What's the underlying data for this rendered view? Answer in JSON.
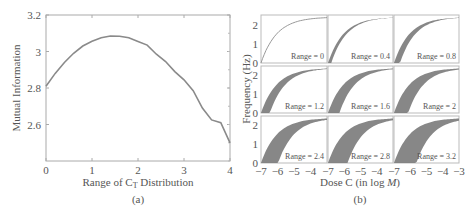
{
  "figure": {
    "caption_a": "(a)",
    "caption_b": "(b)"
  },
  "chart_data": [
    {
      "id": "a",
      "type": "line",
      "title": "",
      "xlabel": "Range of C",
      "xlabel_subscript": "T",
      "xlabel_suffix": " Distribution",
      "ylabel": "Mutual Information",
      "xlim": [
        0,
        4
      ],
      "ylim": [
        2.4,
        3.2
      ],
      "xticks": [
        0,
        1,
        2,
        3,
        4
      ],
      "xtick_labels": [
        "0",
        "1",
        "2",
        "3",
        "4"
      ],
      "yticks": [
        2.6,
        2.8,
        3.0,
        3.2
      ],
      "ytick_labels": [
        "2.6",
        "2.8",
        "3",
        "3.2"
      ],
      "grid": false,
      "series": [
        {
          "name": "Mutual Information",
          "color": "#8a8a8a",
          "x": [
            0,
            0.2,
            0.4,
            0.6,
            0.8,
            1.0,
            1.2,
            1.4,
            1.6,
            1.8,
            2.0,
            2.2,
            2.4,
            2.6,
            2.8,
            3.0,
            3.2,
            3.4,
            3.6,
            3.8,
            4.0
          ],
          "y": [
            2.81,
            2.88,
            2.94,
            2.99,
            3.03,
            3.056,
            3.075,
            3.085,
            3.084,
            3.075,
            3.055,
            3.035,
            2.985,
            2.945,
            2.89,
            2.845,
            2.785,
            2.69,
            2.625,
            2.61,
            2.5
          ]
        }
      ]
    },
    {
      "id": "b",
      "type": "area",
      "title": "",
      "xlabel": "Dose C (in log ",
      "xlabel_italic": "M",
      "xlabel_suffix": ")",
      "ylabel": "Frequency (Hz)",
      "xlim": [
        -7,
        -3
      ],
      "ylim": [
        0,
        2.5
      ],
      "xticks": [
        -7,
        -6,
        -5,
        -4,
        -3
      ],
      "xtick_labels": [
        "−7",
        "−6",
        "−5",
        "−4",
        "−3"
      ],
      "yticks": [
        0,
        1,
        2
      ],
      "ytick_labels": [
        "0",
        "1",
        "2"
      ],
      "layout": "3x3 small multiples",
      "fill_color": "#7a7a7a",
      "panels": [
        {
          "label": "Range = 0",
          "range": 0
        },
        {
          "label": "Range = 0.4",
          "range": 0.4
        },
        {
          "label": "Range = 0.8",
          "range": 0.8
        },
        {
          "label": "Range = 1.2",
          "range": 1.2
        },
        {
          "label": "Range = 1.6",
          "range": 1.6
        },
        {
          "label": "Range = 2",
          "range": 2
        },
        {
          "label": "Range = 2.4",
          "range": 2.4
        },
        {
          "label": "Range = 2.8",
          "range": 2.8
        },
        {
          "label": "Range = 3.2",
          "range": 3.2
        }
      ],
      "curve_model": "Frequency = 2.4 * sigmoid-like saturation of dose; band width grows with range"
    }
  ]
}
